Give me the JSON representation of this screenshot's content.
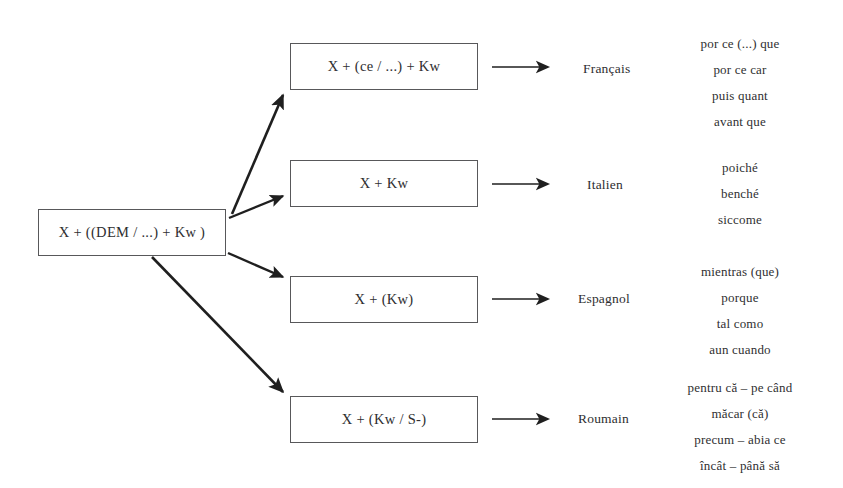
{
  "diagram": {
    "source_node": {
      "label": "X + ((DEM / ...) + Kw )"
    },
    "branches": [
      {
        "formula": "X + (ce / ...) + Kw",
        "language": "Français",
        "examples": [
          "por ce (...) que",
          "por ce car",
          "puis quant",
          "avant que"
        ]
      },
      {
        "formula": "X + Kw",
        "language": "Italien",
        "examples": [
          "poiché",
          "benché",
          "siccome"
        ]
      },
      {
        "formula": "X + (Kw)",
        "language": "Espagnol",
        "examples": [
          "mientras (que)",
          "porque",
          "tal como",
          "aun cuando"
        ]
      },
      {
        "formula": "X + (Kw / S-)",
        "language": "Roumain",
        "examples": [
          "pentru că – pe când",
          "măcar (că)",
          "precum – abia ce",
          "încât – până să"
        ]
      }
    ],
    "colors": {
      "background": "#ffffff",
      "box_border": "#58585a",
      "text": "#2e2e30",
      "arrow": "#1f1f1f"
    }
  }
}
